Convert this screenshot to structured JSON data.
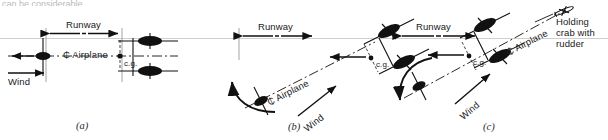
{
  "figure": {
    "top_cut_text": "can be considerable",
    "runway_label": "Runway",
    "wind_label": "Wind",
    "cg_label": "c.g.",
    "centerline_symbol": "₵",
    "airplane_label": "Airplane",
    "crab_label_line1": "Holding",
    "crab_label_line2": "crab with",
    "crab_label_line3": "rudder",
    "ink_color": "#111111",
    "faint_color": "#9a9a9a"
  },
  "panels": [
    {
      "id": "a",
      "caption": "(a)",
      "runway_label": "Runway",
      "wind_label": "Wind",
      "cg_label": "c.g.",
      "centerline_text": "₵ Airplane",
      "heading_deg": 0,
      "wind_arrow_deg": 0,
      "has_rotation_arrow": false,
      "has_crab_note": false,
      "wheel_count": 3
    },
    {
      "id": "b",
      "caption": "(b)",
      "runway_label": "Runway",
      "wind_label": "Wind",
      "cg_label": "c.g.",
      "centerline_text": "₵ Airplane",
      "heading_deg": -27,
      "wind_arrow_deg": -38,
      "has_rotation_arrow": true,
      "rotation_direction": "counterclockwise",
      "has_crab_note": false,
      "wheel_count": 3
    },
    {
      "id": "c",
      "caption": "(c)",
      "runway_label": "Runway",
      "wind_label": "Wind",
      "cg_label": "c.g.",
      "centerline_text": "₵ Airplane",
      "crab_note": "Holding crab with rudder",
      "heading_deg": -27,
      "wind_arrow_deg": -40,
      "has_rotation_arrow": true,
      "rotation_direction": "clockwise-down",
      "has_crab_note": true,
      "wheel_count": 3
    }
  ]
}
